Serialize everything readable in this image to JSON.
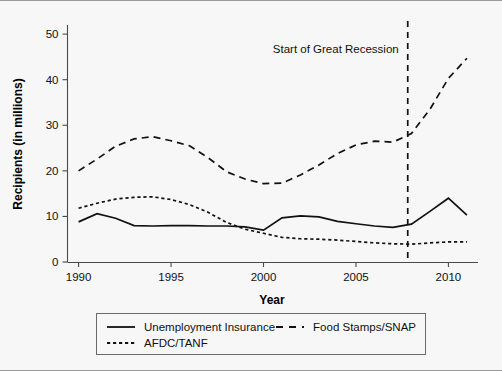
{
  "chart_data": {
    "type": "line",
    "title": "",
    "xlabel": "Year",
    "ylabel": "Recipients (in millions)",
    "xlim": [
      1989.4,
      2011.6
    ],
    "ylim": [
      0,
      52
    ],
    "xticks": [
      1990,
      1995,
      2000,
      2005,
      2010
    ],
    "xticklabels": [
      "1990",
      "1995",
      "2000",
      "2005",
      "2010"
    ],
    "yticks": [
      0,
      10,
      20,
      30,
      40,
      50
    ],
    "yticklabels": [
      "0",
      "10",
      "20",
      "30",
      "40",
      "50"
    ],
    "grid": false,
    "legend_position": "below-axes",
    "x": [
      1990,
      1991,
      1992,
      1993,
      1994,
      1995,
      1996,
      1997,
      1998,
      1999,
      2000,
      2001,
      2002,
      2003,
      2004,
      2005,
      2006,
      2007,
      2008,
      2009,
      2010,
      2011
    ],
    "series": [
      {
        "name": "Unemployment Insurance",
        "style": "solid",
        "values": [
          8.8,
          10.6,
          9.6,
          8.0,
          7.9,
          8.0,
          8.0,
          7.9,
          7.9,
          7.7,
          7.0,
          9.7,
          10.1,
          9.9,
          8.9,
          8.4,
          7.9,
          7.6,
          8.3,
          11.1,
          14.0,
          10.3
        ]
      },
      {
        "name": "Food Stamps/SNAP",
        "style": "long-dash",
        "values": [
          20.0,
          22.6,
          25.4,
          27.0,
          27.5,
          26.6,
          25.5,
          22.9,
          19.8,
          18.2,
          17.2,
          17.3,
          19.1,
          21.3,
          23.8,
          25.7,
          26.5,
          26.3,
          28.2,
          33.5,
          40.3,
          44.7
        ]
      },
      {
        "name": "AFDC/TANF",
        "style": "short-dash",
        "values": [
          11.8,
          12.9,
          13.8,
          14.2,
          14.3,
          13.7,
          12.6,
          10.9,
          8.7,
          7.2,
          6.3,
          5.4,
          5.1,
          5.0,
          4.8,
          4.5,
          4.2,
          4.0,
          3.9,
          4.2,
          4.4,
          4.4
        ]
      }
    ],
    "annotations": [
      {
        "name": "recession-marker",
        "text": "Start of Great Recession",
        "x": 2007.8,
        "line_style": "dashed",
        "text_anchor": "end"
      }
    ]
  },
  "legend": {
    "entries": [
      {
        "label": "Unemployment Insurance",
        "style": "solid"
      },
      {
        "label": "Food Stamps/SNAP",
        "style": "long-dash"
      },
      {
        "label": "AFDC/TANF",
        "style": "short-dash"
      }
    ]
  },
  "colors": {
    "background": "#f7f7f7",
    "line": "#111111",
    "axis": "#4a4a4a",
    "frame": "#9a9a9a"
  }
}
